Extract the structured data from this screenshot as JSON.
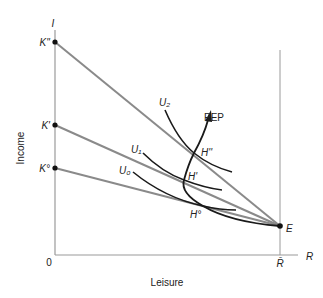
{
  "diagram": {
    "axes": {
      "y_axis_symbol": "I",
      "x_axis_symbol": "R",
      "origin_label": "0",
      "y_axis_title": "Income",
      "x_axis_title": "Leisure",
      "rbar_label": "R̄"
    },
    "intercepts": [
      {
        "label": "K''",
        "y": 42
      },
      {
        "label": "K'",
        "y": 125
      },
      {
        "label": "K°",
        "y": 168
      }
    ],
    "endowment_point": {
      "label": "E"
    },
    "indifference_curves": [
      {
        "label": "U₂"
      },
      {
        "label": "U₁"
      },
      {
        "label": "U₀"
      }
    ],
    "tangency_points": [
      {
        "label": "H''"
      },
      {
        "label": "H'"
      },
      {
        "label": "H°"
      }
    ],
    "path_label": "PEP",
    "colors": {
      "budget_line": "#8a8a8a",
      "axis": "#9a9a9a",
      "curve": "#1a1a1a"
    }
  }
}
